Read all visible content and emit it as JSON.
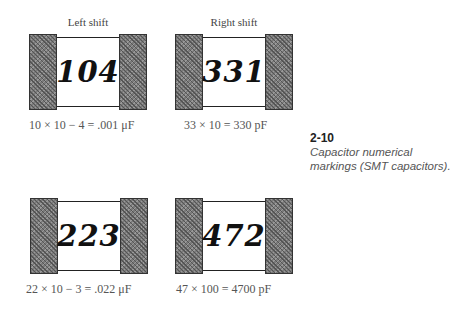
{
  "figure": {
    "number": "2-10",
    "description_line1": "Capacitor numerical",
    "description_line2": "markings (SMT capacitors)."
  },
  "capacitors": [
    {
      "label": "Left shift",
      "code": "104",
      "caption": "10 × 10 − 4 = .001 μF"
    },
    {
      "label": "Right shift",
      "code": "331",
      "caption": "33 × 10 = 330 pF"
    },
    {
      "label": "",
      "code": "223",
      "caption": "22 × 10 − 3 = .022 μF"
    },
    {
      "label": "",
      "code": "472",
      "caption": "47 × 100 = 4700 pF"
    }
  ]
}
